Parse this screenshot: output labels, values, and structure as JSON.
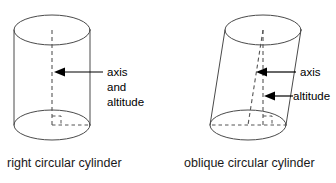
{
  "figure": {
    "background_color": "#ffffff",
    "outline_color": "#4a4a4a",
    "dashed_color": "#555555",
    "label_color": "#000000"
  },
  "left_figure": {
    "name": "right-circular-cylinder",
    "caption": "right circular cylinder",
    "annotation": {
      "line1": "axis",
      "line2": "and",
      "line3": "altitude"
    },
    "geometry": {
      "top_ellipse": {
        "cx": 52,
        "cy": 30,
        "rx": 38,
        "ry": 15
      },
      "bottom_ellipse": {
        "cx": 52,
        "cy": 125,
        "rx": 38,
        "ry": 15
      },
      "axis_line": {
        "x1": 52,
        "y1": 30,
        "x2": 52,
        "y2": 125
      },
      "radius_dash": {
        "x1": 52,
        "y1": 125,
        "x2": 90,
        "y2": 125
      },
      "right_angle_size": 9
    }
  },
  "right_figure": {
    "name": "oblique-circular-cylinder",
    "caption": "oblique circular cylinder",
    "annotations": [
      {
        "key": "axis",
        "label": "axis",
        "target_y": 72
      },
      {
        "key": "altitude",
        "label": "altitude",
        "target_y": 96
      }
    ],
    "geometry": {
      "top_ellipse": {
        "cx": 263,
        "cy": 30,
        "rx": 38,
        "ry": 15
      },
      "bottom_ellipse": {
        "cx": 248,
        "cy": 125,
        "rx": 38,
        "ry": 15
      },
      "axis_line": {
        "x1": 263,
        "y1": 30,
        "x2": 248,
        "y2": 125
      },
      "altitude_line": {
        "x1": 263,
        "y1": 30,
        "x2": 263,
        "y2": 125
      },
      "base_dash": {
        "x1": 248,
        "y1": 125,
        "x2": 286,
        "y2": 125
      },
      "right_angle_size": 9
    }
  }
}
